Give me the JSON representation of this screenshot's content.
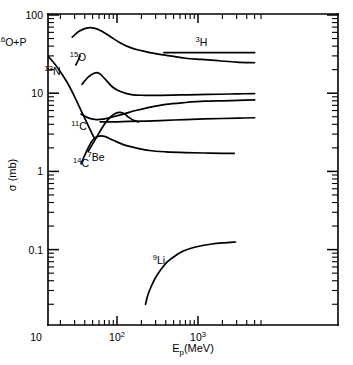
{
  "chart_data": {
    "type": "line",
    "title": "",
    "xlabel": "E_p(MeV)",
    "ylabel": "σ (mb)",
    "xscale": "log",
    "yscale": "log",
    "xlim": [
      2,
      6000
    ],
    "ylim": [
      0.02,
      100
    ],
    "grid": false,
    "legend": "inline-curve-labels",
    "xtick_labels": [
      "10",
      "10²",
      "10³"
    ],
    "xtick_values": [
      10,
      100,
      1000
    ],
    "ytick_labels": [
      "100",
      "10",
      "1",
      "0.1"
    ],
    "ytick_values": [
      100,
      10,
      1,
      0.1
    ],
    "annotations": [
      {
        "name": "reaction-label",
        "text": "¹⁶O+P",
        "sup": "16",
        "base": "O+P",
        "x": 5.0,
        "y": 40
      },
      {
        "name": "curve-label-3H",
        "text": "³H",
        "sup": "3",
        "base": "H",
        "x": 1100,
        "y": 40
      },
      {
        "name": "curve-label-15O",
        "text": "¹⁵O",
        "sup": "15",
        "base": "O",
        "x": 33,
        "y": 26
      },
      {
        "name": "curve-label-13N",
        "text": "¹³N",
        "sup": "13",
        "base": "N",
        "x": 16,
        "y": 17
      },
      {
        "name": "curve-label-11C",
        "text": "¹¹C",
        "sup": "11",
        "base": "C",
        "x": 34,
        "y": 3.4
      },
      {
        "name": "curve-label-14C",
        "text": "¹⁴C",
        "sup": "14",
        "base": "C",
        "x": 36,
        "y": 1.15
      },
      {
        "name": "curve-label-7Be",
        "text": "⁷Be",
        "sup": "7",
        "base": "Be",
        "x": 55,
        "y": 1.35
      },
      {
        "name": "curve-label-9Li",
        "text": "⁹Li",
        "sup": "9",
        "base": "Li",
        "x": 330,
        "y": 0.065
      }
    ],
    "series": [
      {
        "name": "3H",
        "label": "³H",
        "points": [
          [
            28,
            52
          ],
          [
            34,
            62
          ],
          [
            42,
            68
          ],
          [
            52,
            68
          ],
          [
            65,
            62
          ],
          [
            85,
            52
          ],
          [
            110,
            44
          ],
          [
            150,
            38
          ],
          [
            200,
            35
          ],
          [
            300,
            32
          ],
          [
            450,
            30
          ],
          [
            700,
            28
          ],
          [
            1100,
            27
          ],
          [
            1800,
            26
          ],
          [
            3000,
            25
          ],
          [
            5000,
            24.5
          ]
        ]
      },
      {
        "name": "3H-branch",
        "label": "³H second branch",
        "points": [
          [
            380,
            33
          ],
          [
            600,
            33
          ],
          [
            900,
            33
          ],
          [
            1400,
            33
          ],
          [
            2200,
            33
          ],
          [
            3400,
            33
          ],
          [
            5000,
            33
          ]
        ]
      },
      {
        "name": "15O",
        "label": "¹⁵O",
        "points": [
          [
            31,
            23
          ],
          [
            33,
            26
          ],
          [
            35,
            30
          ]
        ]
      },
      {
        "name": "13N",
        "label": "¹³N",
        "points": [
          [
            14,
            30
          ],
          [
            18,
            22
          ],
          [
            24,
            14
          ],
          [
            30,
            9
          ],
          [
            36,
            6
          ],
          [
            42,
            4.3
          ],
          [
            48,
            3.2
          ],
          [
            52,
            2.7
          ]
        ]
      },
      {
        "name": "11C",
        "label": "¹¹C",
        "points": [
          [
            37,
            13
          ],
          [
            44,
            16
          ],
          [
            52,
            18
          ],
          [
            60,
            18
          ],
          [
            72,
            15
          ],
          [
            88,
            12
          ],
          [
            110,
            10.5
          ],
          [
            150,
            9.6
          ],
          [
            220,
            9.4
          ],
          [
            350,
            9.4
          ],
          [
            600,
            9.5
          ],
          [
            1000,
            9.6
          ],
          [
            1800,
            9.7
          ],
          [
            3000,
            9.8
          ],
          [
            5000,
            9.9
          ]
        ]
      },
      {
        "name": "curve-rising",
        "label": "rising curve",
        "points": [
          [
            36,
            5.4
          ],
          [
            45,
            4.8
          ],
          [
            56,
            4.6
          ],
          [
            70,
            4.7
          ],
          [
            90,
            5.0
          ],
          [
            120,
            5.4
          ],
          [
            170,
            6.0
          ],
          [
            250,
            6.6
          ],
          [
            400,
            7.2
          ],
          [
            700,
            7.6
          ],
          [
            1200,
            7.9
          ],
          [
            2000,
            8.0
          ],
          [
            3200,
            8.1
          ],
          [
            5000,
            8.2
          ]
        ]
      },
      {
        "name": "flat-curve",
        "label": "flat curve",
        "points": [
          [
            62,
            4.3
          ],
          [
            90,
            4.3
          ],
          [
            140,
            4.35
          ],
          [
            230,
            4.4
          ],
          [
            400,
            4.5
          ],
          [
            700,
            4.6
          ],
          [
            1200,
            4.7
          ],
          [
            2000,
            4.75
          ],
          [
            3200,
            4.8
          ],
          [
            5000,
            4.85
          ]
        ]
      },
      {
        "name": "7Be",
        "label": "⁷Be",
        "points": [
          [
            44,
            1.8
          ],
          [
            52,
            2.4
          ],
          [
            60,
            3.1
          ],
          [
            70,
            4.0
          ],
          [
            82,
            4.9
          ],
          [
            95,
            5.5
          ],
          [
            110,
            5.7
          ],
          [
            125,
            5.4
          ],
          [
            140,
            4.9
          ],
          [
            160,
            4.5
          ],
          [
            185,
            4.3
          ]
        ]
      },
      {
        "name": "14C",
        "label": "¹⁴C",
        "points": [
          [
            36,
            1.25
          ],
          [
            43,
            1.9
          ],
          [
            50,
            2.5
          ],
          [
            58,
            2.8
          ],
          [
            70,
            2.8
          ],
          [
            90,
            2.5
          ],
          [
            120,
            2.2
          ],
          [
            170,
            2.0
          ],
          [
            250,
            1.85
          ],
          [
            400,
            1.78
          ],
          [
            700,
            1.74
          ],
          [
            1200,
            1.72
          ],
          [
            2000,
            1.7
          ],
          [
            2800,
            1.7
          ]
        ]
      },
      {
        "name": "9Li",
        "label": "⁹Li",
        "points": [
          [
            225,
            0.02
          ],
          [
            240,
            0.026
          ],
          [
            265,
            0.034
          ],
          [
            300,
            0.044
          ],
          [
            350,
            0.056
          ],
          [
            420,
            0.07
          ],
          [
            520,
            0.083
          ],
          [
            650,
            0.095
          ],
          [
            820,
            0.104
          ],
          [
            1100,
            0.112
          ],
          [
            1500,
            0.118
          ],
          [
            2100,
            0.122
          ],
          [
            2900,
            0.125
          ]
        ]
      }
    ]
  },
  "axes": {
    "y_title": "σ (mb)",
    "x_title_base": "E",
    "x_title_sub": "p",
    "x_title_rest": "(MeV)"
  }
}
